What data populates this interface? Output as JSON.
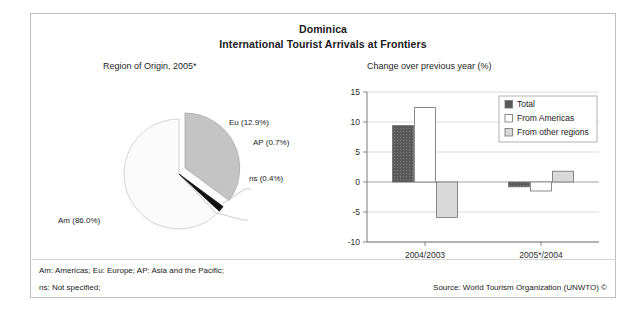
{
  "figure": {
    "title_country": "Dominica",
    "title_subject": "International Tourist Arrivals at Frontiers",
    "footnote_1": "Am: Americas; Eu: Europe; AP: Asia and the Pacific;",
    "footnote_2": "ns: Not specified;",
    "source": "Source: World Tourism Organization (UNWTO) ©"
  },
  "chart_data": [
    {
      "type": "pie",
      "title": "Region of Origin, 2005*",
      "labels": [
        "Am",
        "Eu",
        "AP",
        "ns"
      ],
      "label_texts": [
        "Am (86.0%)",
        "Eu (12.9%)",
        "AP (0.7%)",
        "ns (0.4%)"
      ],
      "values": [
        86.0,
        12.9,
        0.7,
        0.4
      ],
      "units": "%",
      "colors": [
        "#fbfbfb",
        "#c4c4c4",
        "#1a1a1a",
        "#ffffff"
      ],
      "exploded_slice": "Eu",
      "legend": "none"
    },
    {
      "type": "bar",
      "title": "Change over previous year (%)",
      "categories": [
        "2004/2003",
        "2005*/2004"
      ],
      "series": [
        {
          "name": "Total",
          "values": [
            9.4,
            -0.8
          ],
          "color": "#585858"
        },
        {
          "name": "From Americas",
          "values": [
            12.4,
            -1.5
          ],
          "color": "#ffffff"
        },
        {
          "name": "From other regions",
          "values": [
            -5.9,
            1.8
          ],
          "color": "#d9d9d9"
        }
      ],
      "ylabel": "",
      "xlabel": "",
      "ylim": [
        -10,
        15
      ],
      "yticks": [
        15,
        10,
        5,
        0,
        -5,
        -10
      ],
      "ytick_labels": [
        "15",
        "10",
        "5",
        "0",
        "-5",
        "-10"
      ],
      "grid": "horizontal",
      "legend_position": "top-right"
    }
  ]
}
